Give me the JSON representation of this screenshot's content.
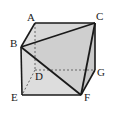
{
  "figure": {
    "kind": "geometry-diagram",
    "background_color": "#ffffff",
    "stroke_color": "#1a1a1a",
    "hidden_stroke_color": "#555555",
    "fill_front": "#dcdcdc",
    "fill_top": "#d2d2d2",
    "fill_right": "#c8c8c8",
    "fill_triangle": "#cfcfcf",
    "labels": [
      {
        "id": "A",
        "text": "A",
        "x": 27,
        "y": 12
      },
      {
        "id": "B",
        "text": "B",
        "x": 10,
        "y": 38
      },
      {
        "id": "C",
        "text": "C",
        "x": 96,
        "y": 11
      },
      {
        "id": "D",
        "text": "D",
        "x": 35,
        "y": 71
      },
      {
        "id": "E",
        "text": "E",
        "x": 11,
        "y": 92
      },
      {
        "id": "F",
        "text": "F",
        "x": 84,
        "y": 92
      },
      {
        "id": "G",
        "text": "G",
        "x": 97,
        "y": 67
      }
    ],
    "vertices": {
      "A": {
        "x": 35,
        "y": 23
      },
      "B": {
        "x": 21,
        "y": 47
      },
      "C": {
        "x": 95,
        "y": 23
      },
      "D": {
        "x": 35,
        "y": 70
      },
      "E": {
        "x": 22,
        "y": 95
      },
      "F": {
        "x": 81,
        "y": 95
      },
      "G": {
        "x": 95,
        "y": 70
      }
    },
    "solid_edges": [
      [
        "A",
        "C"
      ],
      [
        "B",
        "C"
      ],
      [
        "B",
        "F"
      ],
      [
        "C",
        "F"
      ],
      [
        "A",
        "B"
      ],
      [
        "B",
        "E"
      ],
      [
        "E",
        "F"
      ],
      [
        "C",
        "G"
      ],
      [
        "F",
        "G"
      ]
    ],
    "dashed_edges": [
      [
        "A",
        "D"
      ],
      [
        "D",
        "E"
      ],
      [
        "D",
        "G"
      ]
    ]
  }
}
